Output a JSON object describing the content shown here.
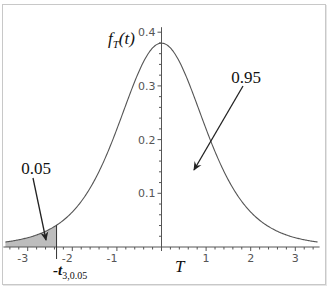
{
  "chart_data": {
    "type": "line",
    "title": "",
    "xlabel": "T",
    "ylabel": "f_T(t)",
    "ylabel_parts": {
      "f": "f",
      "sub": "T",
      "arg": "(t)"
    },
    "xlim": [
      -3.5,
      3.5
    ],
    "ylim": [
      0,
      0.4
    ],
    "x_ticks": [
      -3,
      -2,
      -1,
      1,
      2,
      3
    ],
    "x_tick_labels": [
      "-3",
      "-2",
      "-1",
      "1",
      "2",
      "3"
    ],
    "y_ticks": [
      0.1,
      0.2,
      0.3,
      0.4
    ],
    "y_tick_labels": [
      "0.1",
      "0.2",
      "0.3",
      "0.4"
    ],
    "grid": false,
    "legend": null,
    "curve": {
      "distribution": "student-t",
      "df_visual": 5,
      "x_from": -3.5,
      "x_to": 3.5
    },
    "critical_value": {
      "t": -2.353,
      "label_main": "-t",
      "label_sub": "3,0.05"
    },
    "shaded_region": {
      "from": -3.5,
      "to": -2.353,
      "color": "#bdbdbd",
      "area": 0.05
    },
    "annotations": [
      {
        "text": "0.05",
        "label_x": 36,
        "label_y": 174,
        "arrow_from": [
          33,
          178
        ],
        "arrow_to": [
          46,
          240
        ]
      },
      {
        "text": "0.95",
        "label_x": 246,
        "label_y": 83,
        "arrow_from": [
          243,
          86
        ],
        "arrow_to": [
          194,
          170
        ]
      }
    ]
  },
  "colors": {
    "curve": "#555555",
    "axis": "#555555",
    "shade": "#bdbdbd",
    "arrow": "#222222",
    "frame": "#c8c8c8"
  }
}
